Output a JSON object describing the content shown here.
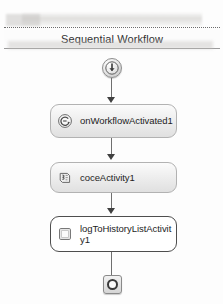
{
  "designer": {
    "title": "Sequential Workflow",
    "start_node": {
      "icon": "circle-down-arrow-icon"
    },
    "end_node": {
      "icon": "stop-ring-icon"
    },
    "activities": [
      {
        "id": "onworkflowactivated",
        "label": "onWorkflowActivated1",
        "icon": "event-handler-icon",
        "selected": false
      },
      {
        "id": "code",
        "label": "coceActivity1",
        "icon": "code-activity-icon",
        "selected": false
      },
      {
        "id": "logtohistory",
        "label": "logToHistoryListActivity1",
        "icon": "log-activity-icon",
        "selected": true
      }
    ],
    "colors": {
      "box_border": "#b2b2b2",
      "selected_border": "#4e4e4e",
      "connector": "#6f6f6f",
      "arrowhead": "#404040",
      "title_text": "#2f2f2f",
      "canvas": "#fdfdfd"
    }
  }
}
